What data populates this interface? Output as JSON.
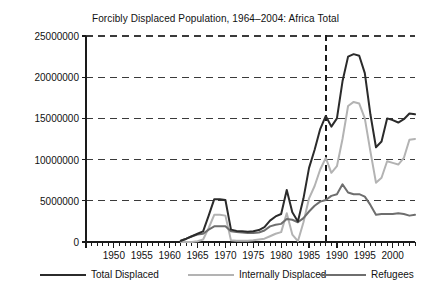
{
  "chart_data": {
    "type": "line",
    "title": "Forcibly Displaced Population, 1964–2004: Africa Total",
    "xlabel": "",
    "ylabel": "",
    "xlim": [
      1945,
      2004
    ],
    "ylim": [
      0,
      25000000
    ],
    "grid": true,
    "grid_style": "dashed-horizontal",
    "legend_position": "below",
    "xtick_labels": [
      "1950",
      "1955",
      "1960",
      "1965",
      "1970",
      "1975",
      "1980",
      "1985",
      "1990",
      "1995",
      "2000"
    ],
    "xticks": [
      1950,
      1955,
      1960,
      1965,
      1970,
      1975,
      1980,
      1985,
      1990,
      1995,
      2000
    ],
    "xtick_minor_step": 1,
    "ytick_labels": [
      "0",
      "5000000",
      "10000000",
      "15000000",
      "20000000",
      "25000000"
    ],
    "yticks": [
      0,
      5000000,
      10000000,
      15000000,
      20000000,
      25000000
    ],
    "annotations": [
      {
        "name": "vertical-reference-line",
        "type": "vline",
        "x": 1988,
        "style": "dashed",
        "color": "#1a1a1a"
      }
    ],
    "x": [
      1962,
      1963,
      1964,
      1965,
      1966,
      1967,
      1968,
      1969,
      1970,
      1971,
      1972,
      1973,
      1974,
      1975,
      1976,
      1977,
      1978,
      1979,
      1980,
      1981,
      1982,
      1983,
      1984,
      1985,
      1986,
      1987,
      1988,
      1989,
      1990,
      1991,
      1992,
      1993,
      1994,
      1995,
      1996,
      1997,
      1998,
      1999,
      2000,
      2001,
      2002,
      2003,
      2004
    ],
    "series": [
      {
        "name": "Total Displaced",
        "color": "#2b2b2b",
        "width": 2.0,
        "values": [
          150000,
          400000,
          700000,
          1000000,
          1300000,
          3200000,
          5200000,
          5200000,
          5100000,
          1500000,
          1350000,
          1300000,
          1250000,
          1300000,
          1450000,
          1800000,
          2600000,
          3100000,
          3400000,
          6300000,
          3600000,
          2500000,
          5300000,
          9000000,
          11200000,
          13700000,
          15300000,
          14000000,
          15000000,
          19500000,
          22500000,
          22800000,
          22600000,
          20500000,
          15500000,
          11500000,
          12200000,
          15000000,
          14800000,
          14500000,
          14900000,
          15600000,
          15500000
        ]
      },
      {
        "name": "Internally Displaced",
        "color": "#b3b3b3",
        "width": 2.0,
        "values": [
          0,
          0,
          0,
          100000,
          300000,
          1700000,
          3300000,
          3300000,
          3200000,
          200000,
          150000,
          150000,
          150000,
          200000,
          300000,
          400000,
          700000,
          1000000,
          1200000,
          3500000,
          900000,
          100000,
          2400000,
          5300000,
          6800000,
          8800000,
          10200000,
          8400000,
          9200000,
          12500000,
          16500000,
          17000000,
          16800000,
          15000000,
          11000000,
          7200000,
          7800000,
          9800000,
          9600000,
          9400000,
          10200000,
          12400000,
          12500000
        ]
      },
      {
        "name": "Refugees",
        "color": "#6e6e6e",
        "width": 2.0,
        "values": [
          150000,
          400000,
          700000,
          900000,
          1000000,
          1500000,
          1900000,
          1900000,
          1900000,
          1300000,
          1200000,
          1150000,
          1100000,
          1100000,
          1150000,
          1400000,
          1900000,
          2100000,
          2200000,
          2800000,
          2700000,
          2400000,
          2900000,
          3700000,
          4400000,
          4900000,
          5100000,
          5600000,
          5800000,
          7000000,
          6000000,
          5800000,
          5800000,
          5500000,
          4500000,
          3300000,
          3400000,
          3400000,
          3400000,
          3500000,
          3400000,
          3200000,
          3300000
        ]
      }
    ]
  },
  "legend": {
    "items": [
      {
        "label": "Total Displaced",
        "color": "#2b2b2b"
      },
      {
        "label": "Internally Displaced",
        "color": "#b3b3b3"
      },
      {
        "label": "Refugees",
        "color": "#6e6e6e"
      }
    ]
  }
}
